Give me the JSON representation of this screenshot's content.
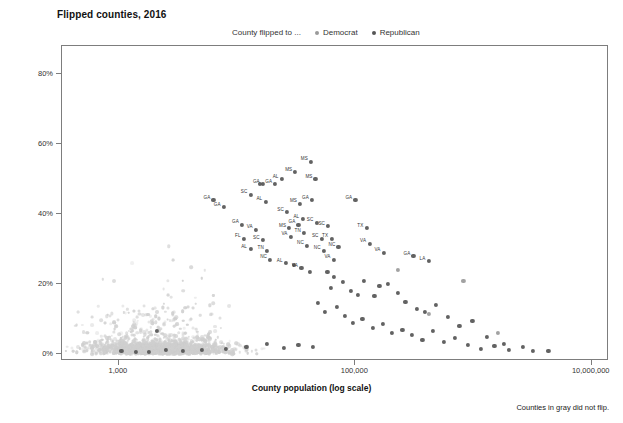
{
  "title": "Flipped counties, 2016",
  "footnote": "Counties in gray did not flip.",
  "legend": {
    "lead": "County flipped to ...",
    "items": [
      {
        "label": "Democrat",
        "color": "#9a9a9a"
      },
      {
        "label": "Republican",
        "color": "#555555"
      }
    ]
  },
  "colors": {
    "democrat": "#9a9a9a",
    "republican": "#555555",
    "no_flip": "#cfcfcf",
    "axis": "#7d7d7d",
    "text": "#1a1a1a"
  },
  "chart_data": {
    "type": "scatter",
    "title": "Flipped counties, 2016",
    "xlabel": "County population (log scale)",
    "ylabel": "Percent black population",
    "xscale": "log",
    "xlim": [
      330,
      14000000
    ],
    "ylim": [
      -2,
      88
    ],
    "grid": false,
    "legend_position": "top",
    "xticks": [
      {
        "value": 1000,
        "label": "1,000"
      },
      {
        "value": 100000,
        "label": "100,000"
      },
      {
        "value": 10000000,
        "label": "10,000,000"
      }
    ],
    "yticks": [
      {
        "value": 0,
        "label": "0%"
      },
      {
        "value": 20,
        "label": "20%"
      },
      {
        "value": 40,
        "label": "40%"
      },
      {
        "value": 60,
        "label": "60%"
      },
      {
        "value": 80,
        "label": "80%"
      }
    ],
    "series": [
      {
        "name": "Republican",
        "color": "#555555",
        "points": [
          {
            "x": 1050,
            "y": 1.0
          },
          {
            "x": 2100,
            "y": 6.5
          },
          {
            "x": 6300,
            "y": 44.0,
            "label": "GA"
          },
          {
            "x": 7700,
            "y": 42.0,
            "label": "GA"
          },
          {
            "x": 11000,
            "y": 37.0,
            "label": "GA"
          },
          {
            "x": 11500,
            "y": 33.0,
            "label": "FL"
          },
          {
            "x": 13000,
            "y": 45.5,
            "label": "SC"
          },
          {
            "x": 15500,
            "y": 48.5
          },
          {
            "x": 16500,
            "y": 48.5,
            "label": "GA"
          },
          {
            "x": 17500,
            "y": 43.5,
            "label": "AL"
          },
          {
            "x": 13000,
            "y": 30.0,
            "label": "AL"
          },
          {
            "x": 14500,
            "y": 35.5,
            "label": "VA"
          },
          {
            "x": 16500,
            "y": 32.5,
            "label": "SC"
          },
          {
            "x": 18000,
            "y": 29.5,
            "label": "TN"
          },
          {
            "x": 19000,
            "y": 27.0,
            "label": "NC"
          },
          {
            "x": 21000,
            "y": 48.5,
            "label": "GA"
          },
          {
            "x": 24000,
            "y": 50.0,
            "label": "AL"
          },
          {
            "x": 26500,
            "y": 40.5,
            "label": "SC"
          },
          {
            "x": 27500,
            "y": 36.0,
            "label": "MS"
          },
          {
            "x": 28500,
            "y": 33.5,
            "label": "VA"
          },
          {
            "x": 31000,
            "y": 52.0,
            "label": "MS"
          },
          {
            "x": 34000,
            "y": 43.0,
            "label": "MS"
          },
          {
            "x": 36000,
            "y": 38.5,
            "label": "AL"
          },
          {
            "x": 33000,
            "y": 37.0,
            "label": "GA"
          },
          {
            "x": 37000,
            "y": 34.5,
            "label": "TN"
          },
          {
            "x": 39000,
            "y": 31.0,
            "label": "NC"
          },
          {
            "x": 42000,
            "y": 55.0,
            "label": "MS"
          },
          {
            "x": 46000,
            "y": 50.0,
            "label": "MS"
          },
          {
            "x": 43000,
            "y": 44.0,
            "label": "GA"
          },
          {
            "x": 47000,
            "y": 37.5,
            "label": "SC"
          },
          {
            "x": 52000,
            "y": 33.0,
            "label": "SC"
          },
          {
            "x": 54000,
            "y": 29.5,
            "label": "NC"
          },
          {
            "x": 59000,
            "y": 36.5,
            "label": "SC"
          },
          {
            "x": 63000,
            "y": 33.0,
            "label": "TX"
          },
          {
            "x": 66000,
            "y": 27.0,
            "label": "VA"
          },
          {
            "x": 72000,
            "y": 30.5,
            "label": "NC"
          },
          {
            "x": 26000,
            "y": 26.0,
            "label": "AL"
          },
          {
            "x": 30000,
            "y": 25.5
          },
          {
            "x": 35000,
            "y": 24.5,
            "label": "VA"
          },
          {
            "x": 41000,
            "y": 23.5
          },
          {
            "x": 58000,
            "y": 23.5
          },
          {
            "x": 66000,
            "y": 22.0
          },
          {
            "x": 100000,
            "y": 44.0,
            "label": "GA"
          },
          {
            "x": 125000,
            "y": 36.0,
            "label": "TX"
          },
          {
            "x": 132000,
            "y": 31.5,
            "label": "VA"
          },
          {
            "x": 175000,
            "y": 29.0,
            "label": "VA"
          },
          {
            "x": 310000,
            "y": 28.0,
            "label": "GA"
          },
          {
            "x": 420000,
            "y": 26.5,
            "label": "LA"
          },
          {
            "x": 62000,
            "y": 19.0
          },
          {
            "x": 78000,
            "y": 20.5
          },
          {
            "x": 92000,
            "y": 18.0
          },
          {
            "x": 105000,
            "y": 17.0
          },
          {
            "x": 118000,
            "y": 21.0
          },
          {
            "x": 145000,
            "y": 16.5
          },
          {
            "x": 160000,
            "y": 19.5
          },
          {
            "x": 190000,
            "y": 20.0
          },
          {
            "x": 230000,
            "y": 17.5
          },
          {
            "x": 265000,
            "y": 15.0
          },
          {
            "x": 330000,
            "y": 13.0
          },
          {
            "x": 390000,
            "y": 12.0
          },
          {
            "x": 480000,
            "y": 14.0
          },
          {
            "x": 610000,
            "y": 10.5
          },
          {
            "x": 760000,
            "y": 8.0
          },
          {
            "x": 980000,
            "y": 9.5
          },
          {
            "x": 1300000,
            "y": 5.0
          },
          {
            "x": 1800000,
            "y": 3.0
          },
          {
            "x": 2600000,
            "y": 2.0
          },
          {
            "x": 48000,
            "y": 14.5
          },
          {
            "x": 55000,
            "y": 12.0
          },
          {
            "x": 70000,
            "y": 13.5
          },
          {
            "x": 82000,
            "y": 11.0
          },
          {
            "x": 95000,
            "y": 9.0
          },
          {
            "x": 115000,
            "y": 10.0
          },
          {
            "x": 140000,
            "y": 7.5
          },
          {
            "x": 170000,
            "y": 8.5
          },
          {
            "x": 205000,
            "y": 6.0
          },
          {
            "x": 250000,
            "y": 7.0
          },
          {
            "x": 300000,
            "y": 5.5
          },
          {
            "x": 370000,
            "y": 4.0
          },
          {
            "x": 450000,
            "y": 6.5
          },
          {
            "x": 560000,
            "y": 3.5
          },
          {
            "x": 700000,
            "y": 4.5
          },
          {
            "x": 900000,
            "y": 2.5
          },
          {
            "x": 1150000,
            "y": 1.5
          },
          {
            "x": 1500000,
            "y": 2.2
          },
          {
            "x": 2000000,
            "y": 1.2
          },
          {
            "x": 3200000,
            "y": 0.8
          },
          {
            "x": 4300000,
            "y": 1.0
          },
          {
            "x": 8000,
            "y": 1.5
          },
          {
            "x": 12000,
            "y": 2.0
          },
          {
            "x": 18000,
            "y": 3.0
          },
          {
            "x": 25000,
            "y": 1.8
          },
          {
            "x": 33000,
            "y": 2.5
          },
          {
            "x": 44000,
            "y": 2.0
          },
          {
            "x": 5000,
            "y": 1.2
          },
          {
            "x": 3500,
            "y": 0.9
          },
          {
            "x": 2500,
            "y": 1.1
          },
          {
            "x": 1800,
            "y": 0.7
          },
          {
            "x": 1400,
            "y": 0.6
          }
        ]
      },
      {
        "name": "Democrat",
        "color": "#9a9a9a",
        "points": [
          {
            "x": 230000,
            "y": 24.0
          },
          {
            "x": 820000,
            "y": 21.0
          },
          {
            "x": 420000,
            "y": 11.5
          },
          {
            "x": 1600000,
            "y": 6.0
          }
        ]
      },
      {
        "name": "Did not flip",
        "color": "#cfcfcf",
        "points": []
      }
    ]
  }
}
